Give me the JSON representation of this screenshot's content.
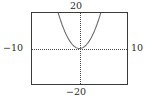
{
  "figure": {
    "name": "coordinate-plane-parabola",
    "background_color": "#ffffff",
    "frame_color": "#3a3a3a",
    "axis_color": "#4a4a4a",
    "curve_color": "#6b6b6b"
  },
  "labels": {
    "top": "20",
    "bottom": "−20",
    "left": "−10",
    "right": "10"
  },
  "chart_data": {
    "type": "line",
    "title": "",
    "xlabel": "",
    "ylabel": "",
    "xlim": [
      -10,
      10
    ],
    "ylim": [
      -20,
      20
    ],
    "xticks": [
      -10,
      -8,
      -6,
      -4,
      -2,
      0,
      2,
      4,
      6,
      8,
      10
    ],
    "xtick_labels": [
      "−10",
      "",
      "",
      "",
      "",
      "",
      "",
      "",
      "",
      "",
      "10"
    ],
    "yticks": [
      -20,
      -15,
      -10,
      -5,
      0,
      5,
      10,
      15,
      20
    ],
    "ytick_labels": [
      "−20",
      "",
      "",
      "",
      "",
      "",
      "",
      "",
      "20"
    ],
    "grid": false,
    "legend": null,
    "axes_style": "dotted-tick-axes-through-origin",
    "series": [
      {
        "name": "parabola",
        "equation": "y = x^2",
        "x": [
          -4.5,
          -4.0,
          -3.5,
          -3.0,
          -2.5,
          -2.0,
          -1.5,
          -1.0,
          -0.5,
          0.0,
          0.5,
          1.0,
          1.5,
          2.0,
          2.5,
          3.0,
          3.5,
          4.0,
          4.5
        ],
        "y": [
          20.25,
          16.0,
          12.25,
          9.0,
          6.25,
          4.0,
          2.25,
          1.0,
          0.25,
          0.0,
          0.25,
          1.0,
          2.25,
          4.0,
          6.25,
          9.0,
          12.25,
          16.0,
          20.25
        ],
        "vertex": [
          0,
          0
        ],
        "opens": "up"
      }
    ]
  }
}
